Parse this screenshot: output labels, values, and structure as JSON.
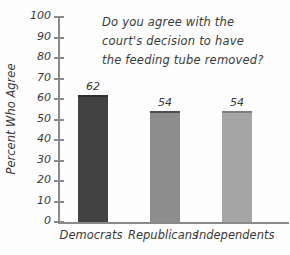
{
  "chart_data": {
    "type": "bar",
    "title_lines": [
      "Do you agree with the",
      "court's decision to have",
      "the feeding tube removed?"
    ],
    "categories": [
      "Democrats",
      "Republicans",
      "Independents"
    ],
    "values": [
      62,
      54,
      54
    ],
    "ylabel": "Percent Who Agree",
    "xlabel": "",
    "ylim": [
      0,
      100
    ],
    "ytick_interval": 10,
    "yticks": [
      "0",
      "10",
      "20",
      "30",
      "40",
      "50",
      "60",
      "70",
      "80",
      "90",
      "100"
    ],
    "grid": false,
    "legend_position": "none",
    "bar_colors": [
      "#424242",
      "#8d8d8d",
      "#a5a5a5"
    ],
    "bar_top_edge_colors": [
      "#2f2f2f",
      "#4e4e4e",
      "#7e7e7e"
    ]
  },
  "colors": {
    "background": "#fdfdfd",
    "axis": "#8a8a8a",
    "text": "#3a3a3a"
  }
}
